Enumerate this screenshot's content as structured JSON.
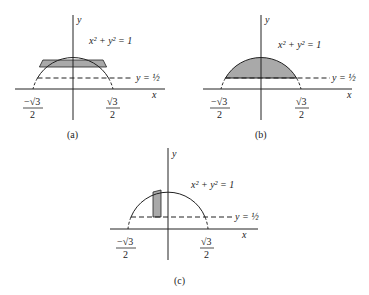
{
  "figure": {
    "panels": [
      {
        "id": "a",
        "caption": "(a)",
        "equation": "x² + y² = 1",
        "line_label": "y = ½",
        "y_axis_label": "y",
        "x_axis_label": "x",
        "left_tick_num": "−√3",
        "left_tick_den": "2",
        "right_tick_num": "√3",
        "right_tick_den": "2",
        "shading": "horizontal strip"
      },
      {
        "id": "b",
        "caption": "(b)",
        "equation": "x² + y² = 1",
        "line_label": "y = ½",
        "y_axis_label": "y",
        "x_axis_label": "x",
        "left_tick_num": "−√3",
        "left_tick_den": "2",
        "right_tick_num": "√3",
        "right_tick_den": "2",
        "shading": "full region above y = 1/2"
      },
      {
        "id": "c",
        "caption": "(c)",
        "equation": "x² + y² = 1",
        "line_label": "y = ½",
        "y_axis_label": "y",
        "x_axis_label": "x",
        "left_tick_num": "−√3",
        "left_tick_den": "2",
        "right_tick_num": "√3",
        "right_tick_den": "2",
        "shading": "vertical strip"
      }
    ],
    "colors": {
      "ink": "#222222",
      "shade": "#a9a9a9",
      "background": "#ffffff"
    }
  }
}
